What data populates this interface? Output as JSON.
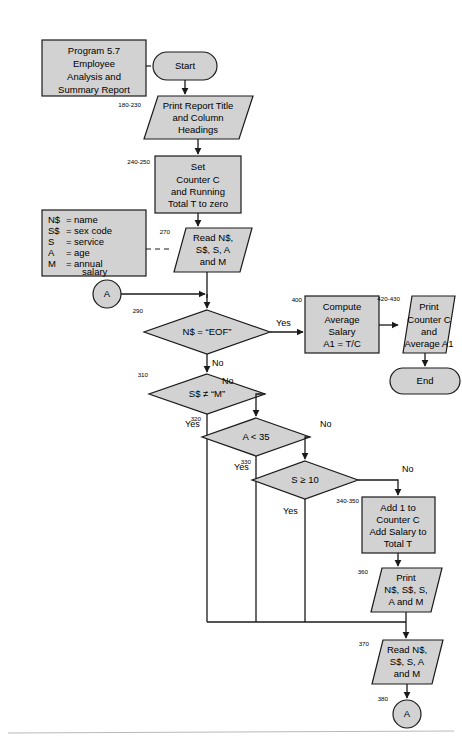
{
  "page": {
    "background_color": "#ffffff",
    "shape_fill_color": "#d2d2d2",
    "shape_stroke_color": "#1a1a1a",
    "footer_rule_color": "#b9b9b9"
  },
  "annotation": {
    "program_label": {
      "lines": [
        "Program 5.7",
        "Employee",
        "Analysis and",
        "Summary Report"
      ]
    },
    "legend": {
      "rows": [
        {
          "symbol": "N$",
          "equals": "=",
          "meaning": "name"
        },
        {
          "symbol": "S$",
          "equals": "=",
          "meaning": "sex code"
        },
        {
          "symbol": "S",
          "equals": "=",
          "meaning": "service"
        },
        {
          "symbol": "A",
          "equals": "=",
          "meaning": "age"
        },
        {
          "symbol": "M",
          "equals": "=",
          "meaning": "annual"
        },
        {
          "symbol": "",
          "equals": "",
          "meaning": "salary"
        }
      ]
    }
  },
  "nodes": {
    "start": {
      "type": "terminator",
      "line_numbers": "",
      "lines": [
        "Start"
      ]
    },
    "print_headings": {
      "type": "io",
      "line_numbers": "180-230",
      "lines": [
        "Print Report Title",
        "and Column",
        "Headings"
      ]
    },
    "set_counters": {
      "type": "process",
      "line_numbers": "240-250",
      "lines": [
        "Set",
        "Counter C",
        "and Running",
        "Total T to zero"
      ]
    },
    "read_first": {
      "type": "io",
      "line_numbers": "270",
      "lines": [
        "Read N$,",
        "S$, S, A",
        "and M"
      ]
    },
    "connector_a_in": {
      "type": "connector",
      "line_numbers": "",
      "lines": [
        "A"
      ]
    },
    "decision_eof": {
      "type": "decision",
      "line_numbers": "290",
      "lines": [
        "N$ = “EOF”"
      ],
      "yes_label": "Yes",
      "no_label": "No"
    },
    "compute_average": {
      "type": "process",
      "line_numbers": "400",
      "lines": [
        "Compute",
        "Average",
        "Salary",
        "A1 = T/C"
      ]
    },
    "print_summary": {
      "type": "io",
      "line_numbers": "420-430",
      "lines": [
        "Print",
        "Counter C",
        "and",
        "Average A1"
      ]
    },
    "end": {
      "type": "terminator",
      "line_numbers": "",
      "lines": [
        "End"
      ]
    },
    "decision_sex": {
      "type": "decision",
      "line_numbers": "310",
      "lines": [
        "S$ ≠ “M”"
      ],
      "yes_label": "Yes",
      "no_label": "No"
    },
    "decision_age": {
      "type": "decision",
      "line_numbers": "320",
      "lines": [
        "A < 35"
      ],
      "yes_label": "Yes",
      "no_label": "No"
    },
    "decision_service": {
      "type": "decision",
      "line_numbers": "330",
      "lines": [
        "S ≥ 10"
      ],
      "yes_label": "Yes",
      "no_label": "No"
    },
    "accumulate": {
      "type": "process",
      "line_numbers": "340-350",
      "lines": [
        "Add 1 to",
        "Counter C",
        "Add Salary to",
        "Total T"
      ]
    },
    "print_detail": {
      "type": "io",
      "line_numbers": "360",
      "lines": [
        "Print",
        "N$, S$, S,",
        "A and M"
      ]
    },
    "read_next": {
      "type": "io",
      "line_numbers": "370",
      "lines": [
        "Read N$,",
        "S$, S, A",
        "and M"
      ]
    },
    "connector_a_out": {
      "type": "connector",
      "line_numbers": "380",
      "lines": [
        "A"
      ]
    }
  }
}
